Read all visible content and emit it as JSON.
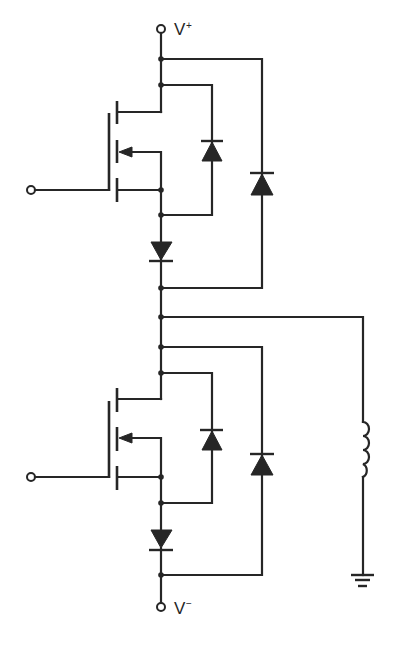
{
  "diagram": {
    "type": "circuit-schematic",
    "colors": {
      "ink": "#262626",
      "background": "#ffffff"
    },
    "terminals": {
      "supply_positive": {
        "label": "V",
        "superscript": "+"
      },
      "supply_negative": {
        "label": "V",
        "superscript": "−"
      },
      "upper_gate": {
        "label": ""
      },
      "lower_gate": {
        "label": ""
      }
    },
    "components": [
      {
        "id": "Q1",
        "kind": "n-channel MOSFET (enhancement)",
        "position": "upper"
      },
      {
        "id": "D1",
        "kind": "diode",
        "role": "body-bypass across Q1",
        "orientation": "anode bottom, cathode top"
      },
      {
        "id": "D2",
        "kind": "diode",
        "role": "series blocking below Q1",
        "orientation": "pointing down"
      },
      {
        "id": "D3",
        "kind": "diode",
        "role": "freewheel from output to V+",
        "orientation": "pointing up"
      },
      {
        "id": "Q2",
        "kind": "n-channel MOSFET (enhancement)",
        "position": "lower"
      },
      {
        "id": "D4",
        "kind": "diode",
        "role": "body-bypass across Q2",
        "orientation": "pointing up"
      },
      {
        "id": "D5",
        "kind": "diode",
        "role": "series blocking below Q2",
        "orientation": "pointing down"
      },
      {
        "id": "D6",
        "kind": "diode",
        "role": "freewheel from V- to output",
        "orientation": "pointing up"
      },
      {
        "id": "L1",
        "kind": "inductor",
        "role": "load"
      },
      {
        "id": "GND",
        "kind": "ground"
      }
    ]
  }
}
